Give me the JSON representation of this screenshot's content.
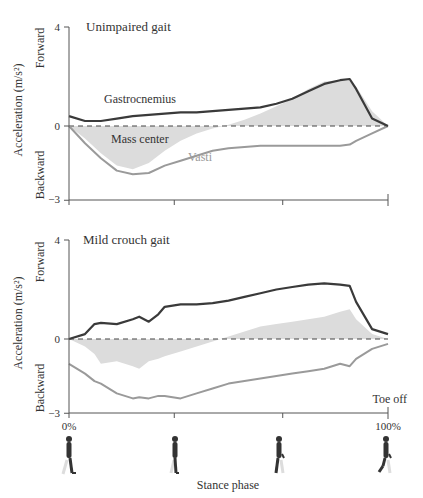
{
  "figure": {
    "x_axis_label": "Stance phase",
    "x_tick_labels": [
      "0%",
      "100%"
    ],
    "toe_off_label": "Toe off",
    "y_axis_label": "Acceleration (m/s²)",
    "forward_label": "Forward",
    "backward_label": "Backward",
    "y_tick_labels": [
      "4",
      "0",
      "−3"
    ],
    "colors": {
      "gastrocnemius": "#3a3a3a",
      "vasti": "#9a9a9a",
      "mass_center": "#dcdcdc",
      "axis": "#555555",
      "zero_line": "#444444"
    },
    "walker_icons": [
      "walking-figure-heel-strike",
      "walking-figure-midstance",
      "walking-figure-late-stance",
      "walking-figure-toe-off"
    ]
  },
  "chart_data": [
    {
      "type": "line",
      "title": "Unimpaired gait",
      "xlabel": "Stance phase",
      "ylabel": "Acceleration (m/s²)",
      "xlim": [
        0,
        100
      ],
      "ylim": [
        -3,
        4
      ],
      "x_ticks": [
        0,
        33,
        67,
        100
      ],
      "y_ticks": [
        -3,
        0,
        4
      ],
      "grid": false,
      "zero_line": "dashed",
      "annotations": [
        "Gastrocnemius",
        "Mass center",
        "Vasti"
      ],
      "x": [
        0,
        5,
        10,
        15,
        20,
        25,
        30,
        35,
        40,
        45,
        50,
        55,
        60,
        65,
        70,
        75,
        80,
        85,
        88,
        90,
        95,
        100
      ],
      "series": [
        {
          "name": "Gastrocnemius",
          "style": "line",
          "values": [
            0.4,
            0.2,
            0.2,
            0.3,
            0.4,
            0.45,
            0.5,
            0.55,
            0.55,
            0.6,
            0.65,
            0.7,
            0.75,
            0.9,
            1.1,
            1.4,
            1.7,
            1.85,
            1.9,
            1.5,
            0.3,
            0.0
          ]
        },
        {
          "name": "Vasti",
          "style": "line",
          "values": [
            0.0,
            -0.7,
            -1.3,
            -1.8,
            -1.95,
            -1.9,
            -1.6,
            -1.4,
            -1.2,
            -1.0,
            -0.9,
            -0.85,
            -0.8,
            -0.8,
            -0.8,
            -0.8,
            -0.8,
            -0.8,
            -0.75,
            -0.6,
            -0.3,
            0.0
          ]
        },
        {
          "name": "Mass center",
          "style": "area",
          "values": [
            0.0,
            -0.5,
            -1.1,
            -1.6,
            -1.75,
            -1.5,
            -1.0,
            -0.6,
            -0.3,
            -0.1,
            0.05,
            0.25,
            0.5,
            0.8,
            1.1,
            1.5,
            1.8,
            1.85,
            1.85,
            1.6,
            0.6,
            0.0
          ]
        }
      ]
    },
    {
      "type": "line",
      "title": "Mild crouch gait",
      "xlabel": "Stance phase",
      "ylabel": "Acceleration (m/s²)",
      "xlim": [
        0,
        100
      ],
      "ylim": [
        -3,
        4
      ],
      "x_ticks": [
        0,
        33,
        67,
        100
      ],
      "y_ticks": [
        -3,
        0,
        4
      ],
      "grid": false,
      "zero_line": "dashed",
      "annotations": [
        "Toe off"
      ],
      "x": [
        0,
        5,
        8,
        10,
        15,
        20,
        22,
        25,
        28,
        30,
        35,
        40,
        45,
        50,
        55,
        60,
        65,
        70,
        75,
        80,
        85,
        88,
        90,
        95,
        100
      ],
      "series": [
        {
          "name": "Gastrocnemius",
          "style": "line",
          "values": [
            0.0,
            0.2,
            0.6,
            0.65,
            0.6,
            0.8,
            0.9,
            0.7,
            1.0,
            1.3,
            1.4,
            1.4,
            1.45,
            1.55,
            1.7,
            1.85,
            2.0,
            2.1,
            2.2,
            2.25,
            2.2,
            2.15,
            1.5,
            0.4,
            0.2
          ]
        },
        {
          "name": "Vasti",
          "style": "line",
          "values": [
            -1.0,
            -1.4,
            -1.7,
            -1.8,
            -2.2,
            -2.4,
            -2.35,
            -2.4,
            -2.3,
            -2.3,
            -2.4,
            -2.2,
            -2.0,
            -1.8,
            -1.7,
            -1.6,
            -1.5,
            -1.4,
            -1.3,
            -1.2,
            -1.0,
            -1.1,
            -0.8,
            -0.4,
            -0.2
          ]
        },
        {
          "name": "Mass center",
          "style": "area",
          "values": [
            0.0,
            -0.3,
            -0.6,
            -1.0,
            -0.9,
            -1.1,
            -1.2,
            -0.9,
            -0.8,
            -0.7,
            -0.5,
            -0.3,
            -0.1,
            0.1,
            0.3,
            0.5,
            0.6,
            0.7,
            0.8,
            0.9,
            1.1,
            1.2,
            0.8,
            0.2,
            0.0
          ]
        }
      ]
    }
  ]
}
